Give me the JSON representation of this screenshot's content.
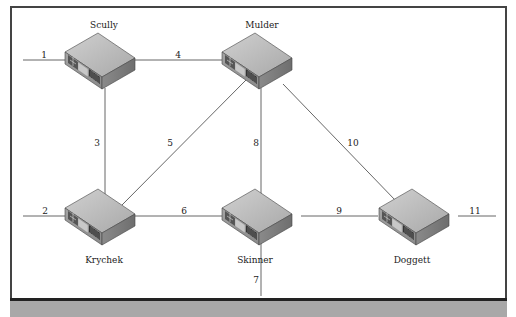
{
  "diagram": {
    "type": "network-topology",
    "colors": {
      "frame": "#444444",
      "footer_band": "#a8a8a8",
      "link": "#555555",
      "switch_top": "#bdbdbd",
      "switch_front": "#9a9a9a",
      "switch_side": "#7a7a7a"
    },
    "nodes": [
      {
        "id": "scully",
        "label": "Scully",
        "x": 100,
        "y": 60
      },
      {
        "id": "mulder",
        "label": "Mulder",
        "x": 257,
        "y": 60
      },
      {
        "id": "krychek",
        "label": "Krychek",
        "x": 100,
        "y": 220
      },
      {
        "id": "skinner",
        "label": "Skinner",
        "x": 257,
        "y": 220
      },
      {
        "id": "doggett",
        "label": "Doggett",
        "x": 414,
        "y": 220
      }
    ],
    "links": [
      {
        "id": "1",
        "label": "1",
        "from": "edge-left",
        "to": "scully"
      },
      {
        "id": "2",
        "label": "2",
        "from": "edge-left",
        "to": "krychek"
      },
      {
        "id": "3",
        "label": "3",
        "from": "scully",
        "to": "krychek"
      },
      {
        "id": "4",
        "label": "4",
        "from": "scully",
        "to": "mulder"
      },
      {
        "id": "5",
        "label": "5",
        "from": "krychek",
        "to": "mulder"
      },
      {
        "id": "6",
        "label": "6",
        "from": "krychek",
        "to": "skinner"
      },
      {
        "id": "7",
        "label": "7",
        "from": "skinner",
        "to": "edge-bottom"
      },
      {
        "id": "8",
        "label": "8",
        "from": "mulder",
        "to": "skinner"
      },
      {
        "id": "9",
        "label": "9",
        "from": "skinner",
        "to": "doggett"
      },
      {
        "id": "10",
        "label": "10",
        "from": "mulder",
        "to": "doggett"
      },
      {
        "id": "11",
        "label": "11",
        "from": "doggett",
        "to": "edge-right"
      }
    ]
  }
}
